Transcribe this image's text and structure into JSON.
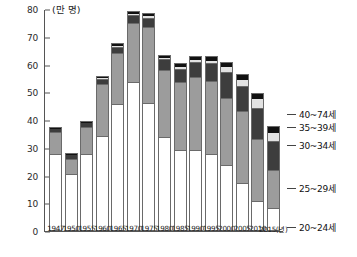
{
  "chart_data": {
    "type": "bar",
    "stacked": true,
    "title": "",
    "unit_label": "(만 명)",
    "xlabel": "",
    "ylabel": "",
    "ylim": [
      0,
      80
    ],
    "yticks": [
      0,
      10,
      20,
      30,
      40,
      50,
      60,
      70,
      80
    ],
    "ytick_labels": [
      "0",
      "10",
      "20",
      "30",
      "40",
      "50",
      "60",
      "70",
      "80"
    ],
    "grid": false,
    "legend_position": "right",
    "categories": [
      "1947",
      "1950",
      "1955",
      "1960",
      "1965",
      "1970",
      "1975",
      "1980",
      "1985",
      "1990",
      "1995",
      "2000",
      "2005",
      "2010",
      "2015"
    ],
    "xtick_labels": [
      "1947",
      "1950",
      "1955",
      "1960",
      "1965",
      "1970",
      "1975",
      "1980",
      "1985",
      "1990",
      "1995",
      "2000",
      "2005",
      "2010",
      "2015(년)"
    ],
    "series": [
      {
        "name": "20~24세",
        "color": "#ffffff",
        "values": [
          27.0,
          20.0,
          27.0,
          33.5,
          45.0,
          53.0,
          45.5,
          33.0,
          28.5,
          28.5,
          27.0,
          23.0,
          16.5,
          10.0,
          7.5
        ]
      },
      {
        "name": "25~29세",
        "color": "#9c9c9c",
        "values": [
          7.5,
          5.0,
          9.5,
          18.5,
          18.0,
          21.0,
          27.0,
          24.0,
          24.0,
          26.0,
          26.0,
          24.0,
          25.5,
          22.0,
          13.5
        ]
      },
      {
        "name": "30~34세",
        "color": "#3d3d3d",
        "values": [
          1.2,
          1.2,
          1.3,
          1.4,
          2.0,
          2.5,
          3.0,
          3.5,
          4.5,
          5.0,
          6.0,
          9.0,
          9.0,
          11.0,
          10.0
        ]
      },
      {
        "name": "35~39세",
        "color": "#e2e2e2",
        "values": [
          0.0,
          0.0,
          0.0,
          0.3,
          0.4,
          0.4,
          0.5,
          0.5,
          0.7,
          0.8,
          1.0,
          1.5,
          2.0,
          3.0,
          3.0
        ]
      },
      {
        "name": "40~74세",
        "color": "#111111",
        "values": [
          0.3,
          0.3,
          0.4,
          0.5,
          0.6,
          0.6,
          0.7,
          0.8,
          0.9,
          1.0,
          1.2,
          1.5,
          1.8,
          2.0,
          2.0
        ]
      }
    ],
    "totals": [
      36.0,
      26.5,
      38.2,
      54.2,
      66.0,
      77.5,
      76.7,
      61.8,
      58.6,
      61.3,
      61.2,
      59.0,
      54.8,
      48.0,
      36.0
    ],
    "legend": [
      {
        "label": "40~74세",
        "color": "#111111"
      },
      {
        "label": "35~39세",
        "color": "#e2e2e2"
      },
      {
        "label": "30~34세",
        "color": "#3d3d3d"
      },
      {
        "label": "25~29세",
        "color": "#9c9c9c"
      },
      {
        "label": "20~24세",
        "color": "#ffffff"
      }
    ]
  }
}
